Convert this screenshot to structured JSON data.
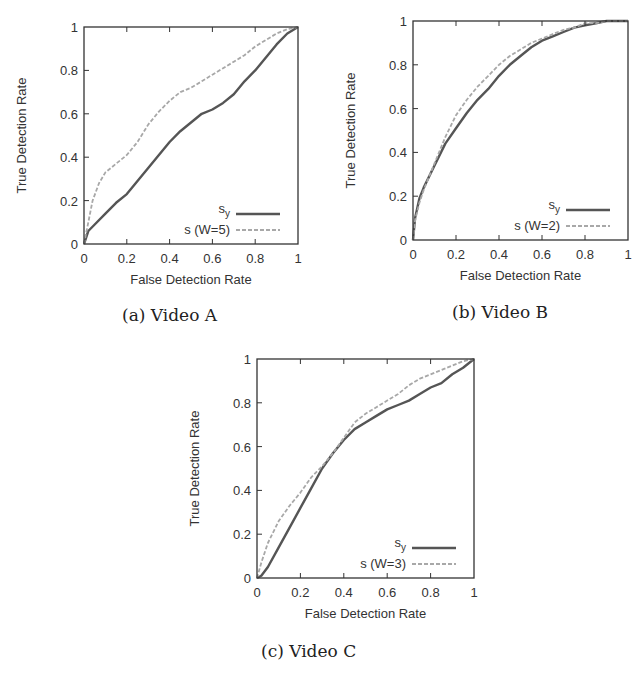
{
  "figures": [
    {
      "id": "a",
      "caption": "(a) Video A"
    },
    {
      "id": "b",
      "caption": "(b) Video B"
    },
    {
      "id": "c",
      "caption": "(c) Video C"
    }
  ],
  "colors": {
    "sy_line": "#555555",
    "s_line": "#a8a8a8",
    "axis": "#333333"
  },
  "chart_data": [
    {
      "type": "line",
      "title": "(a) Video A",
      "xlabel": "False Detection Rate",
      "ylabel": "True Detection Rate",
      "xlim": [
        0,
        1
      ],
      "ylim": [
        0,
        1
      ],
      "xticks": [
        "0",
        "0.2",
        "0.4",
        "0.6",
        "0.8",
        "1"
      ],
      "yticks": [
        "0",
        "0.2",
        "0.4",
        "0.6",
        "0.8",
        "1"
      ],
      "grid": false,
      "legend_position": "lower right",
      "series": [
        {
          "name": "s_y",
          "label_main": "s",
          "label_sub": "y",
          "style": "solid",
          "x": [
            0,
            0.02,
            0.05,
            0.1,
            0.15,
            0.2,
            0.25,
            0.3,
            0.35,
            0.4,
            0.45,
            0.5,
            0.55,
            0.6,
            0.65,
            0.7,
            0.75,
            0.8,
            0.85,
            0.9,
            0.95,
            1.0
          ],
          "y": [
            0,
            0.06,
            0.09,
            0.14,
            0.19,
            0.23,
            0.29,
            0.35,
            0.41,
            0.47,
            0.52,
            0.56,
            0.6,
            0.62,
            0.65,
            0.69,
            0.75,
            0.8,
            0.86,
            0.92,
            0.97,
            1.0
          ]
        },
        {
          "name": "s (W=5)",
          "label_main": "s (W=5)",
          "label_sub": "",
          "style": "dashed",
          "x": [
            0,
            0.02,
            0.04,
            0.07,
            0.1,
            0.15,
            0.2,
            0.25,
            0.3,
            0.35,
            0.4,
            0.45,
            0.5,
            0.55,
            0.6,
            0.65,
            0.7,
            0.75,
            0.8,
            0.85,
            0.9,
            0.95,
            1.0
          ],
          "y": [
            0,
            0.1,
            0.2,
            0.28,
            0.33,
            0.37,
            0.41,
            0.47,
            0.55,
            0.61,
            0.66,
            0.7,
            0.72,
            0.75,
            0.78,
            0.81,
            0.84,
            0.87,
            0.91,
            0.94,
            0.97,
            0.99,
            1.0
          ]
        }
      ]
    },
    {
      "type": "line",
      "title": "(b) Video B",
      "xlabel": "False Detection Rate",
      "ylabel": "True Detection Rate",
      "xlim": [
        0,
        1
      ],
      "ylim": [
        0,
        1
      ],
      "xticks": [
        "0",
        "0.2",
        "0.4",
        "0.6",
        "0.8",
        "1"
      ],
      "yticks": [
        "0",
        "0.2",
        "0.4",
        "0.6",
        "0.8",
        "1"
      ],
      "grid": false,
      "legend_position": "lower right",
      "series": [
        {
          "name": "s_y",
          "label_main": "s",
          "label_sub": "y",
          "style": "solid",
          "x": [
            0,
            0.01,
            0.03,
            0.05,
            0.1,
            0.15,
            0.2,
            0.25,
            0.3,
            0.35,
            0.4,
            0.45,
            0.5,
            0.55,
            0.6,
            0.65,
            0.7,
            0.75,
            0.8,
            0.85,
            0.9,
            0.95,
            1.0
          ],
          "y": [
            0,
            0.1,
            0.19,
            0.24,
            0.34,
            0.44,
            0.51,
            0.58,
            0.64,
            0.69,
            0.75,
            0.8,
            0.84,
            0.88,
            0.91,
            0.93,
            0.95,
            0.97,
            0.98,
            0.99,
            1.0,
            1.0,
            1.0
          ]
        },
        {
          "name": "s (W=2)",
          "label_main": "s (W=2)",
          "label_sub": "",
          "style": "dashed",
          "x": [
            0,
            0.01,
            0.03,
            0.05,
            0.1,
            0.15,
            0.2,
            0.25,
            0.3,
            0.35,
            0.4,
            0.45,
            0.5,
            0.55,
            0.6,
            0.65,
            0.7,
            0.75,
            0.8,
            0.85,
            0.9,
            0.95,
            1.0
          ],
          "y": [
            0,
            0.09,
            0.17,
            0.23,
            0.35,
            0.47,
            0.57,
            0.64,
            0.7,
            0.75,
            0.8,
            0.84,
            0.87,
            0.9,
            0.92,
            0.94,
            0.96,
            0.97,
            0.99,
            0.99,
            1.0,
            1.0,
            1.0
          ]
        }
      ]
    },
    {
      "type": "line",
      "title": "(c) Video C",
      "xlabel": "False Detection Rate",
      "ylabel": "True Detection Rate",
      "xlim": [
        0,
        1
      ],
      "ylim": [
        0,
        1
      ],
      "xticks": [
        "0",
        "0.2",
        "0.4",
        "0.6",
        "0.8",
        "1"
      ],
      "yticks": [
        "0",
        "0.2",
        "0.4",
        "0.6",
        "0.8",
        "1"
      ],
      "grid": false,
      "legend_position": "lower right",
      "series": [
        {
          "name": "s_y",
          "label_main": "s",
          "label_sub": "y",
          "style": "solid",
          "x": [
            0,
            0.02,
            0.05,
            0.1,
            0.15,
            0.2,
            0.25,
            0.3,
            0.35,
            0.4,
            0.45,
            0.5,
            0.55,
            0.6,
            0.65,
            0.7,
            0.75,
            0.8,
            0.85,
            0.9,
            0.95,
            1.0
          ],
          "y": [
            0,
            0.01,
            0.05,
            0.14,
            0.23,
            0.32,
            0.41,
            0.5,
            0.57,
            0.63,
            0.68,
            0.71,
            0.74,
            0.77,
            0.79,
            0.81,
            0.84,
            0.87,
            0.89,
            0.93,
            0.96,
            1.0
          ]
        },
        {
          "name": "s (W=3)",
          "label_main": "s (W=3)",
          "label_sub": "",
          "style": "dashed",
          "x": [
            0,
            0.02,
            0.05,
            0.08,
            0.1,
            0.15,
            0.2,
            0.25,
            0.3,
            0.35,
            0.4,
            0.45,
            0.5,
            0.55,
            0.6,
            0.65,
            0.7,
            0.75,
            0.8,
            0.85,
            0.9,
            0.95,
            1.0
          ],
          "y": [
            0,
            0.07,
            0.16,
            0.22,
            0.26,
            0.33,
            0.39,
            0.46,
            0.51,
            0.57,
            0.64,
            0.71,
            0.75,
            0.78,
            0.81,
            0.84,
            0.88,
            0.91,
            0.93,
            0.95,
            0.97,
            0.99,
            1.0
          ]
        }
      ]
    }
  ]
}
